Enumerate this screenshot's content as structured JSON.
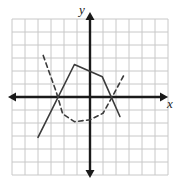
{
  "figure": {
    "title": "",
    "axis_labels": {
      "x": "x",
      "y": "y"
    },
    "background_color": "#ffffff",
    "grid_color": "#c8c8c8",
    "axis_color": "#1a1a1a",
    "curve_color": "#3b3b3b"
  },
  "chart_data": {
    "type": "line",
    "title": "",
    "xlabel": "x",
    "ylabel": "y",
    "xlim": [
      -6,
      6
    ],
    "ylim": [
      -6,
      6
    ],
    "grid": true,
    "grid_step": 1,
    "legend": "none",
    "axes": {
      "x_axis_y_value": 0,
      "y_axis_x_value": 0,
      "arrows": [
        "left",
        "right",
        "up",
        "down"
      ]
    },
    "series": [
      {
        "name": "solid-piecewise",
        "style": "solid",
        "color": "#3b3b3b",
        "points": [
          [
            -4.0,
            -3.1
          ],
          [
            -1.2,
            2.5
          ],
          [
            0.95,
            1.55
          ],
          [
            2.3,
            -1.5
          ]
        ]
      },
      {
        "name": "dashed-curve",
        "style": "dashed",
        "color": "#3b3b3b",
        "points": [
          [
            -3.6,
            3.2
          ],
          [
            -2.6,
            0.4
          ],
          [
            -2.1,
            -1.3
          ],
          [
            -1.2,
            -1.9
          ],
          [
            0.0,
            -1.75
          ],
          [
            1.0,
            -1.25
          ],
          [
            1.7,
            0.0
          ],
          [
            2.7,
            1.85
          ]
        ]
      }
    ]
  }
}
